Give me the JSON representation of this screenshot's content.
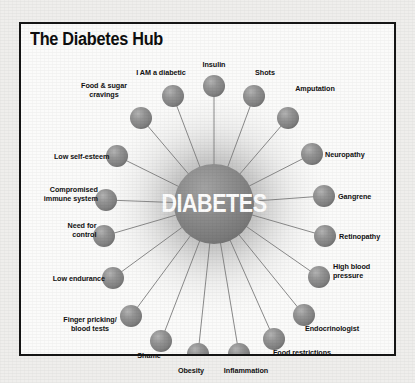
{
  "page": {
    "background_color": "#efeeec",
    "paper_color": "#fbfbfa",
    "border_color": "#161616"
  },
  "title": "The Diabetes Hub",
  "hub": {
    "label": "DIABETES",
    "fill_color": "#8a8a8a",
    "text_color": "#fdfdfd",
    "cx": 193,
    "cy": 180,
    "r": 40
  },
  "node_style": {
    "sphere_color": "#8f8f8f",
    "sphere_radius": 11,
    "spoke_color": "#7d7d7d",
    "label_color": "#111111"
  },
  "chart_data": {
    "type": "diagram",
    "title": "The Diabetes Hub",
    "center": "DIABETES",
    "node_count": 18,
    "nodes": [
      "I AM a diabetic",
      "Insulin",
      "Shots",
      "Amputation",
      "Neuropathy",
      "Gangrene",
      "Retinopathy",
      "High blood pressure",
      "Endocrinologist",
      "Food restrictions",
      "Inflammation",
      "Obesity",
      "Shame",
      "Finger pricking/ blood tests",
      "Low endurance",
      "Need for control",
      "Compromised immune system",
      "Low self-esteem",
      "Food & sugar cravings"
    ]
  },
  "nodes": [
    {
      "id": "insulin",
      "label": "Insulin",
      "cx": 193,
      "cy": 62,
      "label_x": 193,
      "label_y": 36,
      "align": "ctr",
      "lines": 1
    },
    {
      "id": "i-am-a-diabetic",
      "label": "I AM a diabetic",
      "cx": 152,
      "cy": 72,
      "label_x": 140,
      "label_y": 44,
      "align": "ctr",
      "lines": 1
    },
    {
      "id": "shots",
      "label": "Shots",
      "cx": 233,
      "cy": 72,
      "label_x": 244,
      "label_y": 44,
      "align": "ctr",
      "lines": 1
    },
    {
      "id": "food-and-sugar-cravings",
      "label": "Food & sugar\ncravings",
      "cx": 120,
      "cy": 94,
      "label_x": 83,
      "label_y": 62,
      "align": "ctr",
      "lines": 2
    },
    {
      "id": "amputation",
      "label": "Amputation",
      "cx": 267,
      "cy": 94,
      "label_x": 294,
      "label_y": 60,
      "align": "ctr",
      "lines": 1
    },
    {
      "id": "low-self-esteem",
      "label": "Low self-esteem",
      "cx": 96,
      "cy": 132,
      "label_x": 88,
      "label_y": 128,
      "align": "left",
      "lines": 1
    },
    {
      "id": "neuropathy",
      "label": "Neuropathy",
      "cx": 291,
      "cy": 130,
      "label_x": 304,
      "label_y": 126,
      "align": "right",
      "lines": 1
    },
    {
      "id": "compromised-immune-system",
      "label": "Compromised\nimmune system",
      "cx": 85,
      "cy": 176,
      "label_x": 77,
      "label_y": 166,
      "align": "left",
      "lines": 2
    },
    {
      "id": "gangrene",
      "label": "Gangrene",
      "cx": 303,
      "cy": 172,
      "label_x": 317,
      "label_y": 168,
      "align": "right",
      "lines": 1
    },
    {
      "id": "need-for-control",
      "label": "Need for\ncontrol",
      "cx": 83,
      "cy": 212,
      "label_x": 75,
      "label_y": 202,
      "align": "left",
      "lines": 2
    },
    {
      "id": "retinopathy",
      "label": "Retinopathy",
      "cx": 304,
      "cy": 212,
      "label_x": 318,
      "label_y": 208,
      "align": "right",
      "lines": 1
    },
    {
      "id": "low-endurance",
      "label": "Low endurance",
      "cx": 92,
      "cy": 254,
      "label_x": 84,
      "label_y": 250,
      "align": "left",
      "lines": 1
    },
    {
      "id": "high-blood-pressure",
      "label": "High blood\npressure",
      "cx": 298,
      "cy": 253,
      "label_x": 312,
      "label_y": 243,
      "align": "right",
      "lines": 2
    },
    {
      "id": "finger-pricking-blood-tests",
      "label": "Finger pricking/\nblood tests",
      "cx": 110,
      "cy": 292,
      "label_x": 69,
      "label_y": 296,
      "align": "ctr",
      "lines": 2
    },
    {
      "id": "endocrinologist",
      "label": "Endocrinologist",
      "cx": 283,
      "cy": 291,
      "label_x": 311,
      "label_y": 300,
      "align": "ctr",
      "lines": 1
    },
    {
      "id": "shame",
      "label": "Shame",
      "cx": 140,
      "cy": 317,
      "label_x": 128,
      "label_y": 327,
      "align": "ctr",
      "lines": 1
    },
    {
      "id": "food-restrictions",
      "label": "Food restrictions",
      "cx": 253,
      "cy": 315,
      "label_x": 281,
      "label_y": 324,
      "align": "ctr",
      "lines": 1
    },
    {
      "id": "obesity",
      "label": "Obesity",
      "cx": 177,
      "cy": 330,
      "label_x": 170,
      "label_y": 342,
      "align": "ctr",
      "lines": 1
    },
    {
      "id": "inflammation",
      "label": "Inflammation",
      "cx": 218,
      "cy": 330,
      "label_x": 225,
      "label_y": 342,
      "align": "ctr",
      "lines": 1
    }
  ]
}
